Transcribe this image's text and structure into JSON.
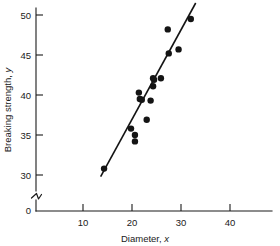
{
  "chart_data": {
    "type": "scatter",
    "title": "",
    "xlabel": "Diameter, x",
    "ylabel": "Breaking strength, y",
    "xlabel_main": "Diameter,",
    "xlabel_var": "x",
    "ylabel_main": "Breaking strength,",
    "ylabel_var": "y",
    "xlim": [
      0,
      47
    ],
    "ylim": [
      29,
      51.5
    ],
    "xticks": [
      10,
      20,
      30,
      40
    ],
    "xtick_labels": [
      "10",
      "20",
      "30",
      "40"
    ],
    "yticks": [
      30,
      35,
      40,
      45,
      50
    ],
    "ytick_labels": [
      "30",
      "35",
      "40",
      "45",
      "50"
    ],
    "y_origin_label": "0",
    "y_axis_break": true,
    "grid": false,
    "legend": null,
    "marker_color": "#141414",
    "line_color": "#141414",
    "axis_color": "#1a1a1a",
    "points": [
      {
        "x": 14.3,
        "y": 30.8
      },
      {
        "x": 19.8,
        "y": 35.8
      },
      {
        "x": 20.6,
        "y": 35.0
      },
      {
        "x": 20.6,
        "y": 34.2
      },
      {
        "x": 21.4,
        "y": 40.3
      },
      {
        "x": 21.6,
        "y": 39.5
      },
      {
        "x": 22.0,
        "y": 39.4
      },
      {
        "x": 23.0,
        "y": 36.9
      },
      {
        "x": 23.8,
        "y": 39.3
      },
      {
        "x": 24.3,
        "y": 42.1
      },
      {
        "x": 24.3,
        "y": 41.1
      },
      {
        "x": 24.5,
        "y": 41.9
      },
      {
        "x": 25.9,
        "y": 42.1
      },
      {
        "x": 27.3,
        "y": 48.2
      },
      {
        "x": 27.5,
        "y": 45.2
      },
      {
        "x": 29.5,
        "y": 45.7
      },
      {
        "x": 32.0,
        "y": 49.5
      }
    ],
    "fit_line": {
      "x_start": 13.6,
      "y_start": 29.8,
      "x_end": 33.0,
      "y_end": 51.5
    }
  }
}
